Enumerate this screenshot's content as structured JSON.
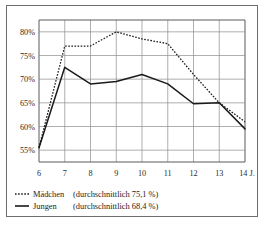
{
  "chart_data": {
    "type": "line",
    "title": "",
    "xlabel": "",
    "ylabel": "",
    "x": [
      6,
      7,
      8,
      9,
      10,
      11,
      12,
      13,
      14
    ],
    "xtick_labels": [
      "6",
      "7",
      "8",
      "9",
      "10",
      "11",
      "12",
      "13",
      "14 J."
    ],
    "ytick_labels": [
      "80%",
      "75%",
      "70%",
      "65%",
      "60%",
      "55%"
    ],
    "ytick_values": [
      80,
      75,
      70,
      65,
      60,
      55
    ],
    "ylim": [
      52.5,
      82.5
    ],
    "xlim": [
      6,
      14
    ],
    "grid": true,
    "legend_position": "below",
    "series": [
      {
        "name": "Mädchen (durchschnittlich 75,1 %)",
        "short_name": "Mädchen",
        "average_label": "(durchschnittlich 75,1 %)",
        "average": 75.1,
        "style": "dotted",
        "color": "#1a1a1a",
        "values": [
          55.5,
          77.0,
          77.0,
          80.0,
          78.5,
          77.5,
          71.0,
          65.0,
          61.0
        ]
      },
      {
        "name": "Jungen (durchschnittlich 68,4 %)",
        "short_name": "Jungen",
        "average_label": "(durchschnittlich 68,4 %)",
        "average": 68.4,
        "style": "solid",
        "color": "#1a1a1a",
        "values": [
          55.5,
          72.5,
          69.0,
          69.5,
          71.0,
          69.0,
          64.8,
          65.0,
          59.5
        ]
      }
    ]
  },
  "legend": {
    "items": [
      {
        "marker": "dotted-line-swatch",
        "label": "Mädchen",
        "note": "(durchschnittlich 75,1 %)"
      },
      {
        "marker": "solid-line-swatch",
        "label": "Jungen",
        "note": "(durchschnittlich 68,4 %)"
      }
    ]
  },
  "colors": {
    "ink": "#1a1a1a",
    "grid": "#8d8d8d",
    "axis": "#5a5a5a",
    "border": "#6e6e6e",
    "background": "#ffffff"
  }
}
